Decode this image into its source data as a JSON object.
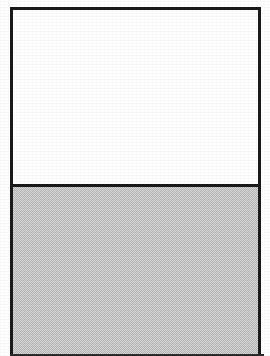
{
  "figure": {
    "width": 270,
    "height": 356,
    "background_color": "#ffffff",
    "frame": {
      "border_color": "#1a1a1a",
      "border_width_px": 3,
      "left_px": 10,
      "top_px": 7,
      "width_px": 251,
      "height_px": 349
    },
    "panels": [
      {
        "id": "upper",
        "fill": "white",
        "fill_color": "#ffffff",
        "content": "",
        "height_px": 174
      },
      {
        "id": "lower",
        "fill": "gray-halftone",
        "fill_color": "#c6c6c6",
        "pattern": "checkerboard-dither",
        "content": "",
        "height_px": 172
      }
    ],
    "divider": {
      "orientation": "horizontal",
      "color": "#1a1a1a",
      "thickness_px": 3,
      "y_px": 181
    },
    "bottom_edge": {
      "color": "#2b2b2b",
      "thickness_px": 2
    }
  }
}
